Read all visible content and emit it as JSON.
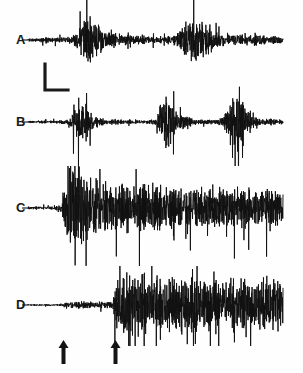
{
  "figure": {
    "background_color": "#fefefe",
    "trace_color": "#111111",
    "width": 303,
    "height": 373
  },
  "labels": {
    "a": "A",
    "b": "B",
    "c": "C",
    "d": "D"
  },
  "scale_bar": {
    "name": "scale-bar",
    "shape": "L",
    "vertical_length_px": 26,
    "horizontal_length_px": 22,
    "x": 44,
    "y": 66
  },
  "arrows": [
    {
      "name": "arrival-arrow-1",
      "glyph": "up-arrow",
      "x": 63,
      "y": 338
    },
    {
      "name": "arrival-arrow-2",
      "glyph": "up-arrow",
      "x": 115,
      "y": 338
    }
  ],
  "chart_data": {
    "type": "line",
    "xlabel": "",
    "ylabel": "",
    "grid": false,
    "legend": "none",
    "x_range": [
      0,
      1
    ],
    "traces": [
      {
        "name": "A",
        "label": "A",
        "baseline_y": 40,
        "x_start": 28,
        "x_end": 283,
        "description": "Continuous low-level noise with two large wavetrain bursts",
        "envelope": [
          [
            0.0,
            0.05
          ],
          [
            0.04,
            0.07
          ],
          [
            0.08,
            0.1
          ],
          [
            0.12,
            0.09
          ],
          [
            0.16,
            0.12
          ],
          [
            0.19,
            0.22
          ],
          [
            0.21,
            0.62
          ],
          [
            0.23,
            1.0
          ],
          [
            0.25,
            0.95
          ],
          [
            0.27,
            0.72
          ],
          [
            0.29,
            0.45
          ],
          [
            0.32,
            0.3
          ],
          [
            0.36,
            0.22
          ],
          [
            0.4,
            0.18
          ],
          [
            0.45,
            0.15
          ],
          [
            0.5,
            0.13
          ],
          [
            0.55,
            0.14
          ],
          [
            0.58,
            0.2
          ],
          [
            0.6,
            0.38
          ],
          [
            0.62,
            0.72
          ],
          [
            0.64,
            0.95
          ],
          [
            0.66,
            1.0
          ],
          [
            0.68,
            0.8
          ],
          [
            0.7,
            0.55
          ],
          [
            0.73,
            0.35
          ],
          [
            0.77,
            0.24
          ],
          [
            0.81,
            0.2
          ],
          [
            0.85,
            0.19
          ],
          [
            0.89,
            0.22
          ],
          [
            0.93,
            0.18
          ],
          [
            0.97,
            0.15
          ],
          [
            1.0,
            0.12
          ]
        ],
        "peak_amplitude_px": 30
      },
      {
        "name": "B",
        "label": "B",
        "baseline_y": 122,
        "x_start": 28,
        "x_end": 283,
        "description": "Quiet baseline with three discrete impulsive bursts",
        "envelope": [
          [
            0.0,
            0.03
          ],
          [
            0.06,
            0.04
          ],
          [
            0.12,
            0.05
          ],
          [
            0.16,
            0.1
          ],
          [
            0.18,
            0.42
          ],
          [
            0.2,
            0.78
          ],
          [
            0.22,
            0.66
          ],
          [
            0.24,
            0.4
          ],
          [
            0.27,
            0.18
          ],
          [
            0.31,
            0.1
          ],
          [
            0.36,
            0.07
          ],
          [
            0.42,
            0.06
          ],
          [
            0.47,
            0.06
          ],
          [
            0.5,
            0.12
          ],
          [
            0.52,
            0.55
          ],
          [
            0.54,
            1.0
          ],
          [
            0.56,
            0.8
          ],
          [
            0.58,
            0.45
          ],
          [
            0.61,
            0.2
          ],
          [
            0.65,
            0.1
          ],
          [
            0.7,
            0.07
          ],
          [
            0.74,
            0.08
          ],
          [
            0.77,
            0.2
          ],
          [
            0.79,
            0.7
          ],
          [
            0.81,
            1.0
          ],
          [
            0.83,
            0.85
          ],
          [
            0.85,
            0.48
          ],
          [
            0.88,
            0.22
          ],
          [
            0.91,
            0.12
          ],
          [
            0.95,
            0.1
          ],
          [
            1.0,
            0.07
          ]
        ],
        "peak_amplitude_px": 34
      },
      {
        "name": "C",
        "label": "C",
        "baseline_y": 208,
        "x_start": 28,
        "x_end": 283,
        "description": "Flat pre-event, abrupt large onset then long slowly decaying coda",
        "envelope": [
          [
            0.0,
            0.03
          ],
          [
            0.05,
            0.03
          ],
          [
            0.1,
            0.04
          ],
          [
            0.13,
            0.05
          ],
          [
            0.14,
            0.35
          ],
          [
            0.16,
            0.85
          ],
          [
            0.18,
            1.0
          ],
          [
            0.2,
            0.92
          ],
          [
            0.22,
            0.7
          ],
          [
            0.25,
            0.58
          ],
          [
            0.29,
            0.5
          ],
          [
            0.33,
            0.46
          ],
          [
            0.38,
            0.44
          ],
          [
            0.43,
            0.42
          ],
          [
            0.48,
            0.41
          ],
          [
            0.53,
            0.4
          ],
          [
            0.58,
            0.39
          ],
          [
            0.63,
            0.38
          ],
          [
            0.68,
            0.37
          ],
          [
            0.73,
            0.36
          ],
          [
            0.78,
            0.36
          ],
          [
            0.83,
            0.35
          ],
          [
            0.88,
            0.35
          ],
          [
            0.93,
            0.34
          ],
          [
            0.97,
            0.33
          ],
          [
            1.0,
            0.32
          ]
        ],
        "peak_amplitude_px": 58
      },
      {
        "name": "D",
        "label": "D",
        "baseline_y": 305,
        "x_start": 28,
        "x_end": 283,
        "description": "Flat, then small emergent P arrival at first arrow, large S onset at second arrow with sustained coda",
        "envelope": [
          [
            0.0,
            0.02
          ],
          [
            0.05,
            0.02
          ],
          [
            0.1,
            0.02
          ],
          [
            0.13,
            0.03
          ],
          [
            0.15,
            0.07
          ],
          [
            0.2,
            0.09
          ],
          [
            0.25,
            0.1
          ],
          [
            0.3,
            0.09
          ],
          [
            0.33,
            0.1
          ],
          [
            0.34,
            0.62
          ],
          [
            0.36,
            0.92
          ],
          [
            0.38,
            1.0
          ],
          [
            0.41,
            0.88
          ],
          [
            0.44,
            0.8
          ],
          [
            0.48,
            0.78
          ],
          [
            0.52,
            0.76
          ],
          [
            0.56,
            0.74
          ],
          [
            0.6,
            0.75
          ],
          [
            0.64,
            0.72
          ],
          [
            0.68,
            0.73
          ],
          [
            0.72,
            0.7
          ],
          [
            0.76,
            0.72
          ],
          [
            0.8,
            0.7
          ],
          [
            0.84,
            0.71
          ],
          [
            0.88,
            0.69
          ],
          [
            0.92,
            0.7
          ],
          [
            0.96,
            0.68
          ],
          [
            1.0,
            0.66
          ]
        ],
        "peak_amplitude_px": 40
      }
    ]
  }
}
